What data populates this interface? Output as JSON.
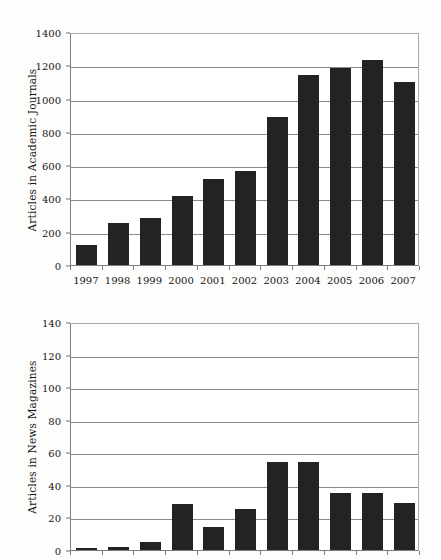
{
  "chart_data": [
    {
      "id": "academic-journals",
      "type": "bar",
      "title": "",
      "xlabel": "",
      "ylabel": "Articles in Academic Journals",
      "categories": [
        "1997",
        "1998",
        "1999",
        "2000",
        "2001",
        "2002",
        "2003",
        "2004",
        "2005",
        "2006",
        "2007"
      ],
      "values": [
        118,
        250,
        283,
        413,
        514,
        562,
        890,
        1140,
        1183,
        1233,
        1100
      ],
      "ylim": [
        0,
        1400
      ],
      "yticks": [
        0,
        200,
        400,
        600,
        800,
        1000,
        1200,
        1400
      ],
      "ytick_labels": [
        "0",
        "200",
        "400",
        "600",
        "800",
        "1000",
        "1200",
        "1400"
      ],
      "grid": true,
      "legend": "none",
      "bar_color": "#232323"
    },
    {
      "id": "news-magazines",
      "type": "bar",
      "title": "",
      "xlabel": "",
      "ylabel": "Articles in News Magazines",
      "categories": [
        "1997",
        "1998",
        "1999",
        "2000",
        "2001",
        "2002",
        "2003",
        "2004",
        "2005",
        "2006",
        "2007"
      ],
      "values": [
        1,
        2,
        5,
        28,
        14,
        25,
        54,
        54,
        35,
        35,
        29
      ],
      "ylim": [
        0,
        140
      ],
      "yticks": [
        0,
        20,
        40,
        60,
        80,
        100,
        120,
        140
      ],
      "ytick_labels": [
        "0",
        "20",
        "40",
        "60",
        "80",
        "100",
        "120",
        "140"
      ],
      "grid": true,
      "legend": "none",
      "bar_color": "#232323",
      "note": "x-axis category labels are cropped off the bottom of the image"
    }
  ]
}
